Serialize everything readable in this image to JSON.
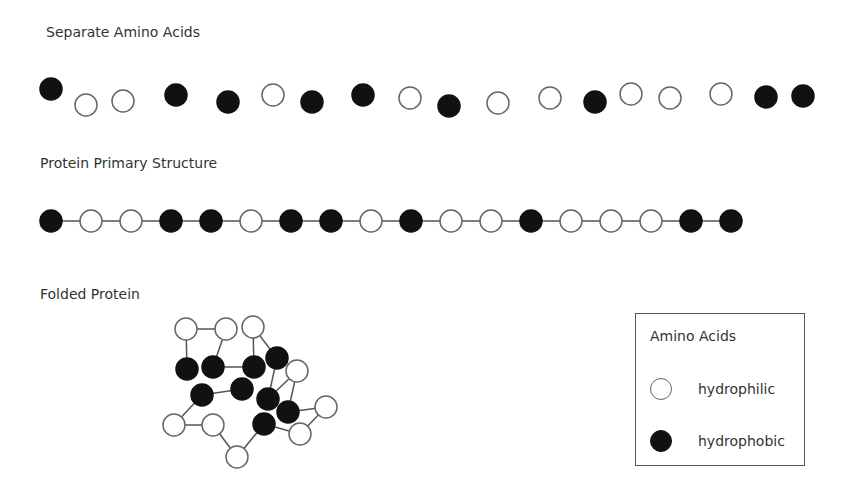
{
  "sections": {
    "separate": {
      "title": "Separate Amino Acids"
    },
    "primary": {
      "title": "Protein Primary Structure"
    },
    "folded": {
      "title": "Folded Protein"
    }
  },
  "legend": {
    "title": "Amino Acids",
    "items": [
      {
        "type": "hydrophilic",
        "label": "hydrophilic"
      },
      {
        "type": "hydrophobic",
        "label": "hydrophobic"
      }
    ]
  },
  "colors": {
    "hydrophobic": "#111111",
    "hydrophilic": "#ffffff",
    "outline": "#666666"
  },
  "separate_beads": [
    {
      "x": 51,
      "y": 89,
      "t": "B"
    },
    {
      "x": 86,
      "y": 105,
      "t": "W"
    },
    {
      "x": 123,
      "y": 101,
      "t": "W"
    },
    {
      "x": 176,
      "y": 95,
      "t": "B"
    },
    {
      "x": 228,
      "y": 102,
      "t": "B"
    },
    {
      "x": 273,
      "y": 95,
      "t": "W"
    },
    {
      "x": 312,
      "y": 102,
      "t": "B"
    },
    {
      "x": 363,
      "y": 95,
      "t": "B"
    },
    {
      "x": 410,
      "y": 98,
      "t": "W"
    },
    {
      "x": 449,
      "y": 106,
      "t": "B"
    },
    {
      "x": 498,
      "y": 103,
      "t": "W"
    },
    {
      "x": 550,
      "y": 98,
      "t": "W"
    },
    {
      "x": 595,
      "y": 102,
      "t": "B"
    },
    {
      "x": 631,
      "y": 94,
      "t": "W"
    },
    {
      "x": 670,
      "y": 98,
      "t": "W"
    },
    {
      "x": 721,
      "y": 94,
      "t": "W"
    },
    {
      "x": 766,
      "y": 97,
      "t": "B"
    },
    {
      "x": 803,
      "y": 96,
      "t": "B"
    }
  ],
  "primary_sequence": [
    "B",
    "W",
    "W",
    "B",
    "B",
    "W",
    "B",
    "B",
    "W",
    "B",
    "W",
    "W",
    "B",
    "W",
    "W",
    "W",
    "B",
    "B"
  ],
  "folded": {
    "nodes": {
      "W1": {
        "x": 186,
        "y": 329,
        "t": "W"
      },
      "W2": {
        "x": 226,
        "y": 329,
        "t": "W"
      },
      "W3": {
        "x": 253,
        "y": 327,
        "t": "W"
      },
      "B1": {
        "x": 187,
        "y": 369,
        "t": "B"
      },
      "B2": {
        "x": 213,
        "y": 367,
        "t": "B"
      },
      "B3": {
        "x": 254,
        "y": 367,
        "t": "B"
      },
      "B4": {
        "x": 277,
        "y": 358,
        "t": "B"
      },
      "W4": {
        "x": 297,
        "y": 371,
        "t": "W"
      },
      "B5": {
        "x": 242,
        "y": 389,
        "t": "B"
      },
      "B6": {
        "x": 202,
        "y": 395,
        "t": "B"
      },
      "B7": {
        "x": 268,
        "y": 399,
        "t": "B"
      },
      "B8": {
        "x": 288,
        "y": 412,
        "t": "B"
      },
      "W5": {
        "x": 326,
        "y": 407,
        "t": "W"
      },
      "W6": {
        "x": 174,
        "y": 425,
        "t": "W"
      },
      "W7": {
        "x": 213,
        "y": 425,
        "t": "W"
      },
      "B9": {
        "x": 264,
        "y": 424,
        "t": "B"
      },
      "W8": {
        "x": 300,
        "y": 434,
        "t": "W"
      },
      "W9": {
        "x": 237,
        "y": 457,
        "t": "W"
      }
    },
    "edges": [
      [
        "W1",
        "W2"
      ],
      [
        "W1",
        "B1"
      ],
      [
        "W2",
        "B2"
      ],
      [
        "W3",
        "B3"
      ],
      [
        "W3",
        "B4"
      ],
      [
        "B2",
        "B3"
      ],
      [
        "B4",
        "B7"
      ],
      [
        "W4",
        "B7"
      ],
      [
        "W4",
        "B8"
      ],
      [
        "B8",
        "W5"
      ],
      [
        "W5",
        "W8"
      ],
      [
        "B9",
        "W8"
      ],
      [
        "B6",
        "B5"
      ],
      [
        "B6",
        "W6"
      ],
      [
        "W6",
        "W7"
      ],
      [
        "W7",
        "W9"
      ],
      [
        "W9",
        "B9"
      ]
    ]
  }
}
